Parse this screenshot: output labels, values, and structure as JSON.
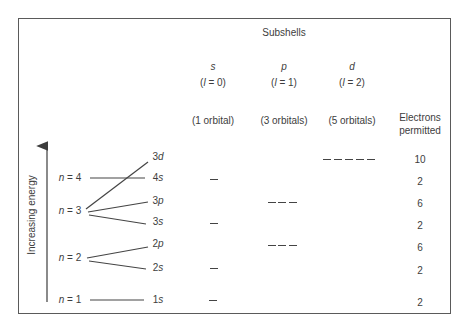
{
  "title": "Subshells",
  "columns": [
    {
      "letter": "s",
      "l_label": "(l = 0)",
      "orbitals": "(1 orbital)"
    },
    {
      "letter": "p",
      "l_label": "(l = 1)",
      "orbitals": "(3 orbitals)"
    },
    {
      "letter": "d",
      "l_label": "(l = 2)",
      "orbitals": "(5 orbitals)"
    }
  ],
  "electrons_header": [
    "Electrons",
    "permitted"
  ],
  "axis_label": "Increasing energy",
  "shells": [
    {
      "label": "n = 4"
    },
    {
      "label": "n = 3"
    },
    {
      "label": "n = 2"
    },
    {
      "label": "n = 1"
    }
  ],
  "subshells": [
    {
      "label": "3d",
      "type": "d",
      "orbitals": 5,
      "electrons": "10"
    },
    {
      "label": "4s",
      "type": "s",
      "orbitals": 1,
      "electrons": "2"
    },
    {
      "label": "3p",
      "type": "p",
      "orbitals": 3,
      "electrons": "6"
    },
    {
      "label": "3s",
      "type": "s",
      "orbitals": 1,
      "electrons": "2"
    },
    {
      "label": "2p",
      "type": "p",
      "orbitals": 3,
      "electrons": "6"
    },
    {
      "label": "2s",
      "type": "s",
      "orbitals": 1,
      "electrons": "2"
    },
    {
      "label": "1s",
      "type": "s",
      "orbitals": 1,
      "electrons": "2"
    }
  ],
  "colors": {
    "ink": "#3d3d3d",
    "border": "#5a5a5a",
    "background": "#ffffff"
  }
}
